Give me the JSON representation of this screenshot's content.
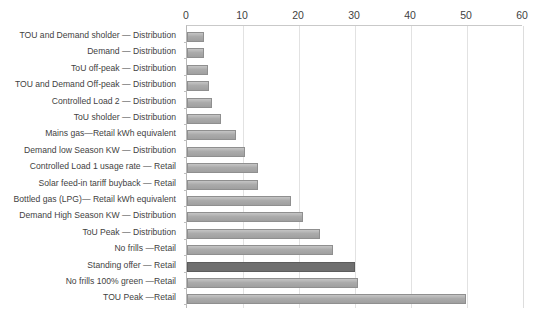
{
  "chart_data": {
    "type": "bar",
    "orientation": "horizontal",
    "title": "",
    "xlabel": "",
    "ylabel": "",
    "xlim": [
      0,
      60
    ],
    "xticks": [
      0,
      10,
      20,
      30,
      40,
      50,
      60
    ],
    "grid": true,
    "legend": false,
    "highlight_category": "Standing offer — Retail",
    "colors": {
      "bar": "#a6a6a6",
      "bar_border": "#8f8f8f",
      "bar_highlight": "#6f6f6f",
      "gridline": "#e2e2e2",
      "axis": "#b8b8b8",
      "text": "#3f3f3f"
    },
    "categories": [
      "TOU and Demand sholder — Distribution",
      "Demand — Distribution",
      "ToU off-peak — Distribution",
      "TOU and Demand Off-peak — Distribution",
      "Controlled Load 2 — Distribution",
      "ToU sholder — Distribution",
      "Mains gas—Retail kWh equivalent",
      "Demand low Season KW — Distribution",
      "Controlled Load 1 usage rate — Retail",
      "Solar feed-in tariff  buyback — Retail",
      "Bottled gas (LPG)— Retail kWh equivalent",
      "Demand High Season KW — Distribution",
      "ToU Peak — Distribution",
      "No frills —Retail",
      "Standing offer — Retail",
      "No frills 100% green —Retail",
      "TOU Peak  —Retail"
    ],
    "values": [
      3.1,
      3.1,
      3.8,
      3.9,
      4.5,
      6.0,
      8.8,
      10.3,
      12.6,
      12.6,
      18.6,
      20.7,
      23.7,
      26.0,
      30.0,
      30.5,
      49.8
    ]
  },
  "axis": {
    "tick_labels": [
      "0",
      "10",
      "20",
      "30",
      "40",
      "50",
      "60"
    ]
  }
}
